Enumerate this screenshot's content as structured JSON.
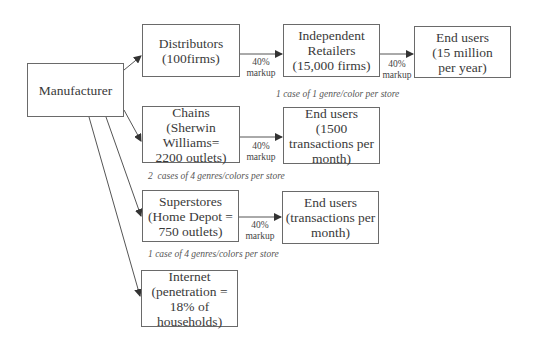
{
  "nodes": {
    "manufacturer": {
      "label": "Manufacturer"
    },
    "distributors": {
      "label": "Distributors\n(100firms)"
    },
    "independent_retailers": {
      "label": "Independent\nRetailers\n(15,000 firms)"
    },
    "end_users_1": {
      "label": "End users\n(15 million\nper year)"
    },
    "chains": {
      "label": "Chains\n(Sherwin\nWilliams=\n2200 outlets)"
    },
    "end_users_2": {
      "label": "End users\n(1500\ntransactions per\nmonth)"
    },
    "superstores": {
      "label": "Superstores\n(Home Depot =\n750 outlets)"
    },
    "end_users_3": {
      "label": "End users\n(transactions per\nmonth)"
    },
    "internet": {
      "label": "Internet\n(penetration =\n18% of\nhouseholds)"
    }
  },
  "markups": [
    {
      "pct": "40%",
      "word": "markup"
    },
    {
      "pct": "40%",
      "word": "markup"
    },
    {
      "pct": "40%",
      "word": "markup"
    },
    {
      "pct": "40%",
      "word": "markup"
    }
  ],
  "notes": {
    "independent": "1 case of 1 genre/color per store",
    "chains": "2  cases of 4 genres/colors per store",
    "superstores": "1 case of 4 genres/colors per store"
  },
  "colors": {
    "line": "#555555",
    "border": "#6a6a6a",
    "text": "#3a3a3a"
  }
}
